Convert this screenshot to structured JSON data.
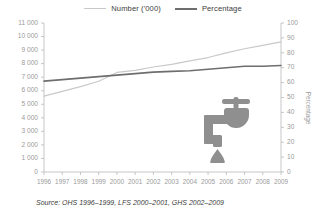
{
  "legend": {
    "items": [
      {
        "label": "Number ('000)",
        "color": "#c9c9c9",
        "key": "number"
      },
      {
        "label": "Percentage",
        "color": "#6e6e6e",
        "key": "percentage"
      }
    ]
  },
  "axes": {
    "left_ticks": [
      "11 000",
      "10 000",
      "9 000",
      "8 000",
      "7 000",
      "6 000",
      "5 000",
      "4 000",
      "3 000",
      "2 000",
      "1 000",
      "0"
    ],
    "right_ticks": [
      "100",
      "90",
      "80",
      "70",
      "60",
      "50",
      "40",
      "30",
      "20",
      "10",
      "0"
    ],
    "right_title": "Percentage"
  },
  "source": {
    "text": "Source: OHS 1996–1999, LFS 2000–2001, GHS 2002–2009"
  },
  "decor": {
    "tap_icon": "faucet-tap-icon",
    "tap_color": "#8f8f8f"
  },
  "chart_data": {
    "type": "line",
    "title": "",
    "xlabel": "",
    "ylabel": "Number ('000)",
    "y2label": "Percentage",
    "categories": [
      "1996",
      "1997",
      "1998",
      "1999",
      "2000",
      "2001",
      "2002",
      "2003",
      "2004",
      "2005",
      "2006",
      "2007",
      "2008",
      "2009"
    ],
    "ylim": [
      0,
      11000
    ],
    "y2lim": [
      0,
      100
    ],
    "grid": false,
    "legend_position": "top-center",
    "series": [
      {
        "name": "Number ('000)",
        "axis": "left",
        "color": "#c9c9c9",
        "values": [
          5600,
          5950,
          6300,
          6700,
          7350,
          7500,
          7750,
          7950,
          8200,
          8450,
          8800,
          9100,
          9350,
          9600
        ]
      },
      {
        "name": "Percentage",
        "axis": "right",
        "color": "#6e6e6e",
        "values": [
          61,
          62,
          63,
          64,
          65,
          66,
          67,
          67.5,
          68,
          69,
          70,
          71,
          71,
          71.5
        ]
      }
    ]
  }
}
